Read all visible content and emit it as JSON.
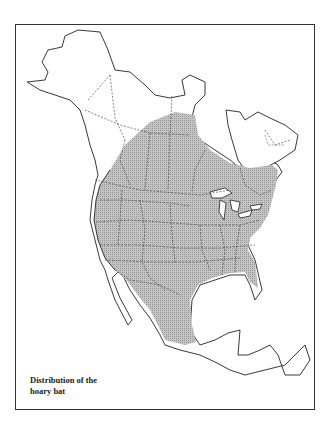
{
  "map": {
    "title": "Distribution of the hoary bat",
    "caption_line1": "Distribution of the",
    "caption_line2": "hoary bat",
    "region": "North America",
    "range_fill_color": "#b8b8b8",
    "outline_color": "#222222"
  }
}
